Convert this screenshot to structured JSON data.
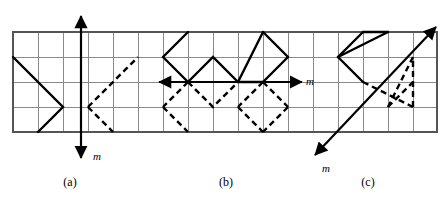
{
  "figure": {
    "background_color": "#ffffff",
    "stroke_color": "#000000",
    "grid_line_color": "#8a8a8a",
    "grid_border_color": "#555555",
    "grid": {
      "cell_size": 25,
      "origin_x": 13,
      "origin_y": 32,
      "cols": 17,
      "rows": 4
    },
    "captions": [
      {
        "id": "caption-a",
        "text": "(a)",
        "x": 70,
        "y": 185
      },
      {
        "id": "caption-b",
        "text": "(b)",
        "x": 226,
        "y": 185
      },
      {
        "id": "caption-c",
        "text": "(c)",
        "x": 368,
        "y": 185
      }
    ],
    "axis_labels": [
      {
        "id": "axis-label-a",
        "text": "m",
        "x": 98,
        "y": 158
      },
      {
        "id": "axis-label-b",
        "text": "m",
        "x": 308,
        "y": 87
      },
      {
        "id": "axis-label-c",
        "text": "m",
        "x": 325,
        "y": 172
      }
    ],
    "panels": [
      {
        "id": "panel-a",
        "label": "(a)",
        "mirror_axis": {
          "name": "vertical-mirror-axis",
          "type": "vertical",
          "x1": 81,
          "y1": 14,
          "x2": 81,
          "y2": 160,
          "arrow_start": true,
          "arrow_end": true
        },
        "solid_path": "M 13 57 L 63 107 L 38 132",
        "dashed_paths": [
          "M 88 107 L 138 57",
          "M 88 107 L 113 132"
        ]
      },
      {
        "id": "panel-b",
        "label": "(b)",
        "mirror_axis": {
          "name": "horizontal-mirror-axis",
          "type": "horizontal",
          "x1": 158,
          "y1": 82,
          "x2": 300,
          "y2": 82,
          "arrow_start": true,
          "arrow_end": true
        },
        "solid_path": "M 163 57 L 188 32 L 188 82 L 213 57 L 238 82 L 263 32 L 263 82 L 288 57 L 263 32",
        "solid_segments": [
          "M 163 57 L 188 32",
          "M 163 57 L 188 82",
          "M 188 82 L 213 57 L 238 82",
          "M 238 82 L 263 32",
          "M 263 32 L 288 57",
          "M 288 57 L 263 82",
          "M 263 82 L 238 82"
        ],
        "dashed_segments": [
          "M 188 82 L 163 107",
          "M 163 107 L 188 132",
          "M 188 82 L 213 107",
          "M 213 107 L 238 82",
          "M 263 82 L 238 107",
          "M 238 107 L 263 132",
          "M 263 82 L 288 107",
          "M 288 107 L 263 132"
        ]
      },
      {
        "id": "panel-c",
        "label": "(c)",
        "mirror_axis": {
          "name": "diagonal-mirror-axis",
          "type": "diagonal",
          "x1": 313,
          "y1": 157,
          "x2": 437,
          "y2": 26,
          "arrow_start": true,
          "arrow_end": true
        },
        "solid_segments": [
          "M 338 57 L 363 32",
          "M 363 32 L 388 32",
          "M 388 32 L 338 57",
          "M 338 57 L 363 82"
        ],
        "dashed_segments": [
          "M 363 82 L 413 107",
          "M 413 107 L 413 57",
          "M 413 57 L 388 107",
          "M 388 107 L 413 82"
        ]
      }
    ]
  }
}
